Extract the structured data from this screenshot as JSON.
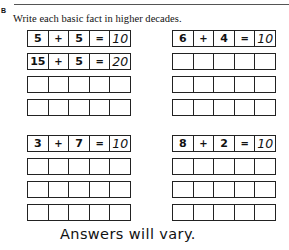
{
  "section": {
    "label": "B",
    "instruction": "Write each basic fact in higher decades."
  },
  "grids": [
    {
      "rows": [
        [
          "5",
          "+",
          "5",
          "=",
          "10"
        ],
        [
          "15",
          "+",
          "5",
          "=",
          "20"
        ],
        [
          "",
          "",
          "",
          "",
          ""
        ],
        [
          "",
          "",
          "",
          "",
          ""
        ]
      ]
    },
    {
      "rows": [
        [
          "6",
          "+",
          "4",
          "=",
          "10"
        ],
        [
          "",
          "",
          "",
          "",
          ""
        ],
        [
          "",
          "",
          "",
          "",
          ""
        ],
        [
          "",
          "",
          "",
          "",
          ""
        ]
      ]
    },
    {
      "rows": [
        [
          "3",
          "+",
          "7",
          "=",
          "10"
        ],
        [
          "",
          "",
          "",
          "",
          ""
        ],
        [
          "",
          "",
          "",
          "",
          ""
        ],
        [
          "",
          "",
          "",
          "",
          ""
        ]
      ]
    },
    {
      "rows": [
        [
          "8",
          "+",
          "2",
          "=",
          "10"
        ],
        [
          "",
          "",
          "",
          "",
          ""
        ],
        [
          "",
          "",
          "",
          "",
          ""
        ],
        [
          "",
          "",
          "",
          "",
          ""
        ]
      ]
    }
  ],
  "footnote": "Answers will vary."
}
